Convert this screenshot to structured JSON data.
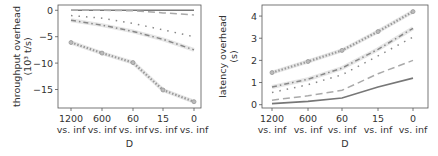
{
  "chart_data": [
    {
      "type": "line",
      "title": "",
      "xlabel": "D",
      "ylabel": "throughput overhead (10^3 t/s)",
      "ylabel_lines": [
        "throughput overhead",
        "(10³ t/s)"
      ],
      "categories": [
        "1200 vs. inf",
        "600 vs. inf",
        "60 vs. inf",
        "15 vs. inf",
        "0 vs. inf"
      ],
      "tick_top": [
        "1200",
        "600",
        "60",
        "15",
        "0"
      ],
      "tick_bottom": [
        "vs. inf",
        "vs. inf",
        "vs. inf",
        "vs. inf",
        "vs. inf"
      ],
      "yticks": [
        "0",
        "-5",
        "-10",
        "-15"
      ],
      "ylim": [
        -18.5,
        1
      ],
      "grid": false,
      "series": [
        {
          "name": "s1",
          "style": "solid",
          "values": [
            0,
            0,
            0,
            0,
            0
          ]
        },
        {
          "name": "s2",
          "style": "dashed",
          "values": [
            0,
            0,
            -0.1,
            -0.5,
            -0.9
          ]
        },
        {
          "name": "s3",
          "style": "dotted-sparse",
          "values": [
            -1,
            -1.5,
            -2.5,
            -3.7,
            -5
          ]
        },
        {
          "name": "s4",
          "style": "dashdot",
          "values": [
            -1.9,
            -2.8,
            -4,
            -5.5,
            -7.5
          ]
        },
        {
          "name": "s5",
          "style": "dotted-marker",
          "values": [
            -6.1,
            -8.1,
            -9.9,
            -15.1,
            -17.3
          ]
        }
      ]
    },
    {
      "type": "line",
      "title": "",
      "xlabel": "D",
      "ylabel": "latency overhead (s)",
      "ylabel_lines": [
        "latency overhead",
        "(s)"
      ],
      "categories": [
        "1200 vs. inf",
        "600 vs. inf",
        "60 vs. inf",
        "15 vs. inf",
        "0 vs. inf"
      ],
      "tick_top": [
        "1200",
        "600",
        "60",
        "15",
        "0"
      ],
      "tick_bottom": [
        "vs. inf",
        "vs. inf",
        "vs. inf",
        "vs. inf",
        "vs. inf"
      ],
      "yticks": [
        "0",
        "1",
        "2",
        "3",
        "4"
      ],
      "ylim": [
        -0.15,
        4.5
      ],
      "grid": false,
      "series": [
        {
          "name": "s1",
          "style": "solid",
          "values": [
            0.05,
            0.15,
            0.3,
            0.8,
            1.2
          ]
        },
        {
          "name": "s2",
          "style": "dashed",
          "values": [
            0.2,
            0.4,
            0.65,
            1.4,
            2.0
          ]
        },
        {
          "name": "s3",
          "style": "dotted-sparse",
          "values": [
            0.55,
            0.9,
            1.35,
            2.2,
            3.05
          ]
        },
        {
          "name": "s4",
          "style": "dashdot",
          "values": [
            0.8,
            1.15,
            1.65,
            2.5,
            3.45
          ]
        },
        {
          "name": "s5",
          "style": "dotted-marker",
          "values": [
            1.45,
            1.95,
            2.45,
            3.3,
            4.2
          ]
        }
      ]
    }
  ]
}
